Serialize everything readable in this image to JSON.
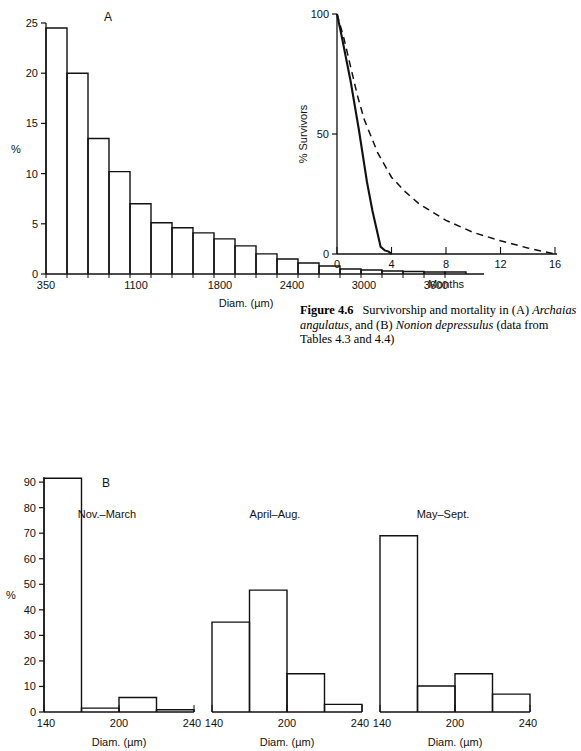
{
  "figure": {
    "number": "Figure 4.6",
    "caption_text": "Survivorship and mortality in (A) Archaias angulatus, and (B) Nonion depressulus (data from Tables 4.3 and 4.4)",
    "caption_parts": {
      "label": "Figure 4.6",
      "seg1": "Survivorship and mortality in (A) ",
      "italic1": "Archaias angulatus",
      "seg2": ", and (B) ",
      "italic2": "Nonion depressulus",
      "seg3": " (data from Tables 4.3 and 4.4)"
    }
  },
  "panel_A": {
    "panel_label": "A",
    "ylabel": "%",
    "xlabel": "Diam. (µm)",
    "y_ticks": [
      "0",
      "5",
      "10",
      "15",
      "20",
      "25"
    ],
    "x_ticks": [
      "350",
      "1100",
      "1800",
      "2400",
      "3000",
      "3600"
    ]
  },
  "panel_B": {
    "panel_label": "B",
    "ylabel": "%",
    "y_ticks": [
      "0",
      "10",
      "20",
      "30",
      "40",
      "50",
      "60",
      "70",
      "80",
      "90"
    ],
    "x_ticks": [
      "140",
      "200",
      "240"
    ],
    "xlabel": "Diam. (µm)",
    "groups": [
      "Nov.–March",
      "April–Aug.",
      "May–Sept."
    ]
  },
  "panel_surv": {
    "ylabel": "% Survivors",
    "xlabel": "Months",
    "y_ticks": [
      "0",
      "50",
      "100"
    ],
    "x_ticks": [
      "0",
      "4",
      "8",
      "12",
      "16"
    ]
  },
  "chart_data": [
    {
      "type": "bar",
      "id": "A",
      "title": "A",
      "xlabel": "Diam. (µm)",
      "ylabel": "%",
      "ylim": [
        0,
        25
      ],
      "xlim": [
        350,
        3850
      ],
      "bin_width": 175,
      "bin_starts": [
        350,
        525,
        700,
        875,
        1050,
        1225,
        1400,
        1575,
        1750,
        1925,
        2100,
        2275,
        2450,
        2625,
        2800,
        2975,
        3150,
        3325,
        3500,
        3675
      ],
      "categories": [
        "350-525",
        "525-700",
        "700-875",
        "875-1050",
        "1050-1225",
        "1225-1400",
        "1400-1575",
        "1575-1750",
        "1750-1925",
        "1925-2100",
        "2100-2275",
        "2275-2450",
        "2450-2625",
        "2625-2800",
        "2800-2975",
        "2975-3150",
        "3150-3325",
        "3325-3500",
        "3500-3675",
        "3675-3850"
      ],
      "values": [
        24.5,
        20.0,
        13.5,
        10.2,
        7.0,
        5.1,
        4.6,
        4.1,
        3.5,
        2.8,
        2.0,
        1.5,
        1.1,
        0.8,
        0.5,
        0.4,
        0.3,
        0.25,
        0.2,
        0.2
      ],
      "grid": false,
      "legend": "none"
    },
    {
      "type": "line",
      "id": "survivorship",
      "title": "Figure 4.6 Survivorship",
      "xlabel": "Months",
      "ylabel": "% Survivors",
      "xlim": [
        0,
        16
      ],
      "ylim": [
        0,
        100
      ],
      "grid": false,
      "legend": "none",
      "series": [
        {
          "name": "A Archaias angulatus",
          "style": "solid",
          "x": [
            0,
            0.3,
            1.0,
            1.6,
            2.2,
            2.6,
            3.0,
            3.2,
            3.5,
            3.8,
            4.0
          ],
          "y": [
            100,
            92,
            72,
            52,
            30,
            18,
            8,
            3,
            1.5,
            1.0,
            0
          ]
        },
        {
          "name": "B Nonion depressulus",
          "style": "dashed",
          "x": [
            0,
            0.5,
            1.0,
            1.5,
            2.0,
            3.0,
            4.0,
            5.0,
            6.0,
            8.0,
            10.0,
            12.0,
            14.0,
            16.0
          ],
          "y": [
            100,
            90,
            78,
            66,
            56,
            42,
            32,
            26,
            21,
            14,
            9,
            5.5,
            2.5,
            0
          ]
        }
      ]
    },
    {
      "type": "bar",
      "id": "B-nov-march",
      "title": "Nov.–March",
      "xlabel": "Diam. (µm)",
      "ylabel": "%",
      "ylim": [
        0,
        92
      ],
      "xlim": [
        140,
        240
      ],
      "bin_width": 25,
      "categories": [
        "140-165",
        "165-190",
        "190-215",
        "215-240"
      ],
      "values": [
        91.5,
        1.5,
        5.7,
        0.9
      ],
      "grid": false,
      "legend": "none"
    },
    {
      "type": "bar",
      "id": "B-april-aug",
      "title": "April–Aug.",
      "xlabel": "Diam. (µm)",
      "ylabel": "%",
      "ylim": [
        0,
        92
      ],
      "xlim": [
        140,
        240
      ],
      "bin_width": 25,
      "categories": [
        "140-165",
        "165-190",
        "190-215",
        "215-240"
      ],
      "values": [
        35.2,
        47.7,
        15.0,
        3.0
      ],
      "grid": false,
      "legend": "none"
    },
    {
      "type": "bar",
      "id": "B-may-sept",
      "title": "May–Sept.",
      "xlabel": "Diam. (µm)",
      "ylabel": "%",
      "ylim": [
        0,
        92
      ],
      "xlim": [
        140,
        240
      ],
      "bin_width": 25,
      "categories": [
        "140-165",
        "165-190",
        "190-215",
        "215-240"
      ],
      "values": [
        69.0,
        10.2,
        15.0,
        7.0
      ],
      "grid": false,
      "legend": "none"
    }
  ]
}
